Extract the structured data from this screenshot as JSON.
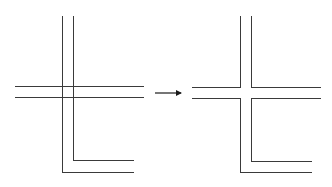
{
  "diagram": {
    "type": "line-merge-transformation",
    "colors": {
      "line": "#3a3a3a",
      "arrow": "#1a1a1a",
      "background": "#ffffff"
    },
    "before": {
      "label": "",
      "segments": [
        {
          "id": "v-outer",
          "points": [
            [
              62,
              16
            ],
            [
              62,
              172
            ],
            [
              134,
              172
            ]
          ]
        },
        {
          "id": "v-inner",
          "points": [
            [
              73,
              16
            ],
            [
              73,
              160
            ],
            [
              134,
              160
            ]
          ]
        },
        {
          "id": "h-top",
          "points": [
            [
              15,
              86
            ],
            [
              144,
              86
            ]
          ]
        },
        {
          "id": "h-bottom",
          "points": [
            [
              15,
              97
            ],
            [
              144,
              97
            ]
          ]
        }
      ]
    },
    "arrow": {
      "from": [
        155,
        93
      ],
      "to": [
        181,
        93
      ]
    },
    "after": {
      "label": "",
      "segments": [
        {
          "id": "top-left-corner",
          "points": [
            [
              240,
              16
            ],
            [
              240,
              87
            ],
            [
              192,
              87
            ]
          ]
        },
        {
          "id": "top-right-corner",
          "points": [
            [
              251,
              16
            ],
            [
              251,
              87
            ],
            [
              321,
              87
            ]
          ]
        },
        {
          "id": "bottom-left-path",
          "points": [
            [
              192,
              98
            ],
            [
              240,
              98
            ],
            [
              240,
              172
            ],
            [
              312,
              172
            ]
          ]
        },
        {
          "id": "bottom-right-path",
          "points": [
            [
              321,
              98
            ],
            [
              251,
              98
            ],
            [
              251,
              161
            ],
            [
              312,
              161
            ]
          ]
        }
      ]
    }
  }
}
